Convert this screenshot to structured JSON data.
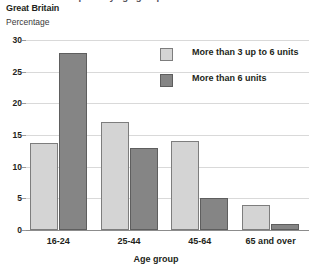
{
  "header": {
    "cropped_title": "Alcohol consumption by age group",
    "region": "Great Britain",
    "unit": "Percentage"
  },
  "chart_data": {
    "type": "bar",
    "title": "",
    "xlabel": "Age group",
    "ylabel": "Percentage",
    "categories": [
      "16-24",
      "25-44",
      "45-64",
      "65 and over"
    ],
    "series": [
      {
        "name": "More than 3 up to 6 units",
        "color": "#d4d4d4",
        "values": [
          13.8,
          17,
          14,
          4
        ]
      },
      {
        "name": "More than 6 units",
        "color": "#858585",
        "values": [
          28,
          13,
          5,
          1
        ]
      }
    ],
    "ylim": [
      0,
      30
    ],
    "yticks": [
      0,
      5,
      10,
      15,
      20,
      25,
      30
    ],
    "ytick_labels": [
      "0",
      "5",
      "10",
      "15",
      "20",
      "25",
      "30"
    ],
    "grid": true,
    "legend_position": "top-right"
  },
  "legend": {
    "items": [
      {
        "label": "More than 3 up to 6 units",
        "swatch": "light"
      },
      {
        "label": "More than 6 units",
        "swatch": "dark"
      }
    ]
  }
}
